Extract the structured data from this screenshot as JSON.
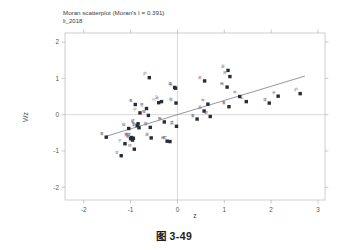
{
  "figure": {
    "caption": "图 3-49",
    "background_color": "#ffffff"
  },
  "chart_data": {
    "type": "scatter",
    "title": "Moran scatterplot (Moran's I = 0.391)",
    "subtitle": "li_2018",
    "xlabel": "z",
    "ylabel": "Wz",
    "xlim": [
      -2.4,
      3.15
    ],
    "ylim": [
      -2.35,
      2.25
    ],
    "xticks": [
      -2,
      -1,
      0,
      1,
      2,
      3
    ],
    "yticks": [
      -2,
      -1,
      0,
      1,
      2
    ],
    "xtick_labels": [
      "-2",
      "-1",
      "0",
      "1",
      "2",
      "3"
    ],
    "ytick_labels": [
      "-2",
      "-1",
      "0",
      "1",
      "2"
    ],
    "grid": false,
    "legend": "none",
    "reference_lines": {
      "vertical_x": 0,
      "horizontal_y": 0
    },
    "morans_i": 0.391,
    "fit_line": {
      "slope": 0.391,
      "intercept": 0.0,
      "x_start": -1.52,
      "x_end": 2.72
    },
    "marker_color": "#2b2b33",
    "fit_line_color": "#7a7a8c",
    "points": [
      {
        "x": -1.52,
        "y": -0.62,
        "label": "青"
      },
      {
        "x": -1.2,
        "y": -1.13,
        "label": "甘"
      },
      {
        "x": -1.12,
        "y": -0.8,
        "label": "宁"
      },
      {
        "x": -1.04,
        "y": -0.38,
        "label": "桂"
      },
      {
        "x": -1.0,
        "y": -0.66,
        "label": "贵"
      },
      {
        "x": -0.98,
        "y": -0.63,
        "label": "云"
      },
      {
        "x": -0.96,
        "y": -0.7,
        "label": "新"
      },
      {
        "x": -0.94,
        "y": -0.65,
        "label": "藏"
      },
      {
        "x": -0.92,
        "y": -0.95,
        "label": "琼"
      },
      {
        "x": -0.9,
        "y": 0.28,
        "label": "黑"
      },
      {
        "x": -0.86,
        "y": -0.3,
        "label": "吉"
      },
      {
        "x": -0.84,
        "y": -0.25,
        "label": "辽"
      },
      {
        "x": -0.82,
        "y": -0.36,
        "label": "蒙"
      },
      {
        "x": -0.8,
        "y": 0.05,
        "label": "宁"
      },
      {
        "x": -0.66,
        "y": 0.17,
        "label": "晋"
      },
      {
        "x": -0.62,
        "y": -0.02,
        "label": "豫"
      },
      {
        "x": -0.6,
        "y": 1.02,
        "label": "沪"
      },
      {
        "x": -0.58,
        "y": -0.35,
        "label": "陕"
      },
      {
        "x": -0.56,
        "y": -0.64,
        "label": "湘"
      },
      {
        "x": -0.4,
        "y": 0.33,
        "label": "川"
      },
      {
        "x": -0.34,
        "y": 0.36,
        "label": "渝"
      },
      {
        "x": -0.28,
        "y": -0.2,
        "label": "赣"
      },
      {
        "x": -0.22,
        "y": -0.73,
        "label": "闽"
      },
      {
        "x": -0.16,
        "y": -0.74,
        "label": "皖"
      },
      {
        "x": -0.06,
        "y": 0.75,
        "label": "津"
      },
      {
        "x": -0.04,
        "y": 0.73,
        "label": "京"
      },
      {
        "x": -0.03,
        "y": 0.32,
        "label": "鄂"
      },
      {
        "x": -0.02,
        "y": -0.32,
        "label": "冀"
      },
      {
        "x": 0.42,
        "y": -0.12,
        "label": "鲁"
      },
      {
        "x": 0.57,
        "y": 0.1,
        "label": "浙"
      },
      {
        "x": 0.58,
        "y": 0.93,
        "label": "苏"
      },
      {
        "x": 0.65,
        "y": 0.29,
        "label": "粤"
      },
      {
        "x": 0.7,
        "y": -0.05,
        "label": "湖"
      },
      {
        "x": 1.06,
        "y": 0.76,
        "label": "闽"
      },
      {
        "x": 1.08,
        "y": 1.22,
        "label": "浙"
      },
      {
        "x": 1.12,
        "y": 1.05,
        "label": "苏"
      },
      {
        "x": 1.1,
        "y": 0.22,
        "label": "鲁"
      },
      {
        "x": 1.33,
        "y": 0.5,
        "label": "粤"
      },
      {
        "x": 1.47,
        "y": 0.36,
        "label": "上"
      },
      {
        "x": 1.96,
        "y": 0.32,
        "label": "津"
      },
      {
        "x": 2.15,
        "y": 0.51,
        "label": "京"
      },
      {
        "x": 2.62,
        "y": 0.58,
        "label": "沪"
      }
    ]
  }
}
